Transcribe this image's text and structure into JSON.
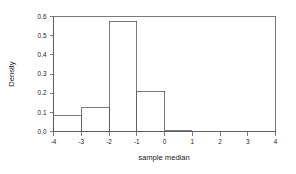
{
  "chart_data": {
    "type": "bar",
    "subtype": "histogram",
    "title": "",
    "xlabel": "sample median",
    "ylabel": "Density",
    "xlim": [
      -4,
      4
    ],
    "ylim": [
      0.0,
      0.6
    ],
    "grid": false,
    "legend": null,
    "bin_width": 1,
    "bin_edges": [
      -4,
      -3,
      -2,
      -1,
      0,
      1
    ],
    "categories": [
      "[-4,-3]",
      "[-3,-2]",
      "[-2,-1]",
      "[-1,0]",
      "[0,1]"
    ],
    "values": [
      0.085,
      0.125,
      0.575,
      0.21,
      0.005
    ],
    "x_ticks": [
      -4,
      -3,
      -2,
      -1,
      0,
      1,
      2,
      3,
      4
    ],
    "x_tick_labels": [
      "-4",
      "-3",
      "-2",
      "-1",
      "0",
      "1",
      "2",
      "3",
      "4"
    ],
    "y_ticks": [
      0.0,
      0.1,
      0.2,
      0.3,
      0.4,
      0.5,
      0.6
    ],
    "y_tick_labels": [
      "0.0",
      "0.1",
      "0.2",
      "0.3",
      "0.4",
      "0.5",
      "0.6"
    ],
    "colors": {
      "line": "#5a5a5a",
      "text": "#1a1a1a",
      "background": "#ffffff"
    }
  },
  "axis": {
    "x_title": "sample median",
    "y_title": "Density"
  }
}
